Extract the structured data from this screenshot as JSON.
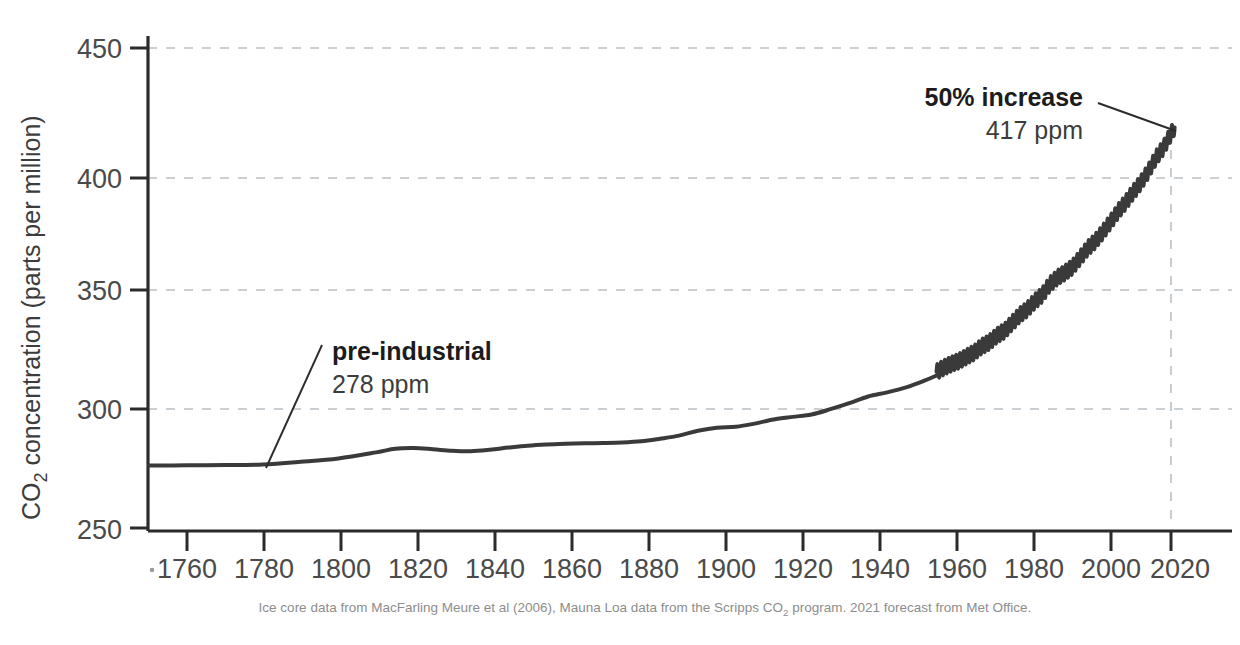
{
  "chart_data": {
    "type": "line",
    "title": "",
    "xlabel": "",
    "ylabel": "CO2 concentration (parts per million)",
    "ylabel_parts": {
      "pre": "CO",
      "sub": "2",
      "post": " concentration (parts per million)"
    },
    "xlim": [
      1750,
      2030
    ],
    "ylim": [
      250,
      450
    ],
    "grid": "horizontal-dashed",
    "legend_position": "none",
    "y_ticks": [
      250,
      300,
      350,
      400,
      450
    ],
    "x_ticks": [
      1760,
      1780,
      1800,
      1820,
      1840,
      1860,
      1880,
      1900,
      1920,
      1940,
      1960,
      1980,
      2000,
      2020
    ],
    "series": [
      {
        "name": "Ice core record (MacFarling Meure et al 2006)",
        "x": [
          1750,
          1760,
          1770,
          1780,
          1790,
          1800,
          1810,
          1815,
          1820,
          1825,
          1830,
          1835,
          1840,
          1845,
          1850,
          1855,
          1860,
          1865,
          1870,
          1875,
          1880,
          1885,
          1890,
          1895,
          1900,
          1905,
          1910,
          1915,
          1920,
          1925,
          1930,
          1935,
          1940,
          1945,
          1950,
          1955,
          1958
        ],
        "values": [
          276.0,
          276.1,
          276.2,
          276.5,
          277.6,
          279.0,
          281.5,
          283.0,
          283.3,
          282.8,
          282.2,
          282.0,
          282.6,
          283.5,
          284.3,
          284.8,
          285.1,
          285.3,
          285.4,
          285.6,
          286.1,
          287.2,
          288.5,
          290.5,
          291.8,
          292.2,
          293.5,
          295.2,
          296.3,
          297.3,
          299.5,
          302.0,
          304.8,
          306.5,
          308.6,
          311.5,
          313.5
        ]
      },
      {
        "name": "Mauna Loa record (Scripps CO2 program)",
        "x": [
          1958,
          1960,
          1962,
          1964,
          1966,
          1968,
          1970,
          1972,
          1974,
          1976,
          1978,
          1980,
          1982,
          1984,
          1986,
          1988,
          1990,
          1992,
          1994,
          1996,
          1998,
          2000,
          2002,
          2004,
          2006,
          2008,
          2010,
          2012,
          2014,
          2016,
          2018,
          2020,
          2021
        ],
        "values": [
          315.0,
          316.9,
          318.4,
          319.6,
          321.4,
          323.1,
          325.7,
          327.4,
          330.2,
          332.1,
          335.4,
          338.7,
          341.1,
          344.4,
          347.2,
          351.6,
          354.4,
          356.4,
          358.8,
          362.6,
          366.6,
          369.5,
          373.3,
          377.5,
          381.9,
          385.6,
          389.9,
          393.8,
          398.6,
          404.2,
          408.5,
          414.2,
          417.0
        ]
      }
    ],
    "annotations": [
      {
        "id": "pre-industrial",
        "title": "pre-industrial",
        "value": "278 ppm",
        "point_year": 1780,
        "point_value": 276.5
      },
      {
        "id": "fifty-percent-increase",
        "title": "50% increase",
        "value": "417 ppm",
        "point_year": 2021,
        "point_value": 417.0
      }
    ],
    "marker_line": {
      "year": 2020,
      "style": "dashed",
      "label": ""
    },
    "footnote": "Ice core data from MacFarling Meure et al (2006), Mauna Loa data from the Scripps CO2 program. 2021 forecast from Met Office.",
    "footnote_parts": {
      "a": "Ice core data from MacFarling Meure et al (2006), Mauna Loa data from the Scripps CO",
      "sub": "2",
      "b": " program. 2021 forecast from Met Office."
    },
    "colors": {
      "line": "#3a3a3a",
      "axis": "#2b2b2b",
      "grid": "#b9c0c6",
      "text": "#3c3c3c",
      "footnote": "#8d8d8d",
      "background": "#ffffff"
    }
  }
}
